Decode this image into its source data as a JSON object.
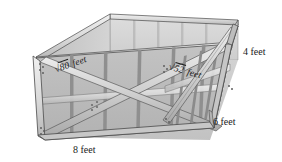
{
  "figure": {
    "kind": "3d-perspective-diagram",
    "background_color": "#ffffff",
    "palette": {
      "outline": "#3a3a3a",
      "interior_back_face": "#d8d8d8",
      "interior_left_face": "#c9c9c9",
      "interior_floor_face": "#cfcfcf",
      "front_panel": "#b9b9b9",
      "right_panel": "#b0b0b0",
      "frame_member_light": "#e2e2e2",
      "frame_member_mid": "#c4c4c4",
      "frame_member_dark": "#9a9a9a",
      "top_rail_highlight": "#ededed",
      "bolt": "#6e6e6e"
    },
    "labels": [
      {
        "id": "sqrt80",
        "text": "√80 feet",
        "radical_symbol": "√",
        "radicand": "80",
        "unit": "feet",
        "style": "italic",
        "placement": "front-face-diagonal-brace",
        "rotation_deg": -19
      },
      {
        "id": "sqrt52",
        "text": "√52 feet",
        "radical_symbol": "√",
        "radicand": "52",
        "unit": "feet",
        "style": "italic",
        "placement": "right-face-diagonal-brace",
        "rotation_deg": 16
      },
      {
        "id": "height",
        "text": "4 feet",
        "value": 4,
        "unit": "feet",
        "style": "plain",
        "placement": "right-vertical-edge",
        "rotation_deg": 0
      },
      {
        "id": "depth",
        "text": "6 feet",
        "value": 6,
        "unit": "feet",
        "style": "plain",
        "placement": "bottom-right-edge",
        "rotation_deg": 0
      },
      {
        "id": "width",
        "text": "8 feet",
        "value": 8,
        "unit": "feet",
        "style": "plain",
        "placement": "bottom-front-edge",
        "rotation_deg": 0
      }
    ],
    "dimensions": {
      "width_feet": 8,
      "depth_feet": 6,
      "height_feet": 4,
      "front_face_diagonal": "√80 feet",
      "right_face_diagonal": "√52 feet"
    }
  }
}
